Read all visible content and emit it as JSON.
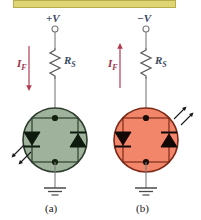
{
  "figure": {
    "title_bar_color": "#dfd574",
    "background": "#ffffff",
    "panels": [
      {
        "id": "a",
        "caption": "(a)",
        "supply_label": "+V",
        "supply_polarity": "positive",
        "current_label": "I",
        "current_subscript": "F",
        "current_direction": "down",
        "resistor_label": "R",
        "resistor_subscript": "S",
        "device_fill_color": "#9fb39c",
        "device_stroke_color": "#2f3d2e",
        "device_state": "off",
        "light_arrows": {
          "count": 2,
          "direction": "down-left",
          "position": "lower-left"
        },
        "ground_symbol": "earth-ground",
        "diodes": [
          {
            "position": "left",
            "orientation": "pointing-down"
          },
          {
            "position": "right",
            "orientation": "pointing-up"
          }
        ]
      },
      {
        "id": "b",
        "caption": "(b)",
        "supply_label": "−V",
        "supply_polarity": "negative",
        "current_label": "I",
        "current_subscript": "F",
        "current_direction": "up",
        "resistor_label": "R",
        "resistor_subscript": "S",
        "device_fill_color": "#f2866b",
        "device_stroke_color": "#7d2a16",
        "device_state": "on",
        "light_arrows": {
          "count": 2,
          "direction": "up-right",
          "position": "upper-right"
        },
        "ground_symbol": "earth-ground",
        "diodes": [
          {
            "position": "left",
            "orientation": "pointing-down"
          },
          {
            "position": "right",
            "orientation": "pointing-up"
          }
        ]
      }
    ],
    "colors": {
      "wire": "#7a7a7a",
      "current_arrow": "#b03c52",
      "label_text": "#3c4a63",
      "caption_text": "#1a1a1a"
    }
  }
}
